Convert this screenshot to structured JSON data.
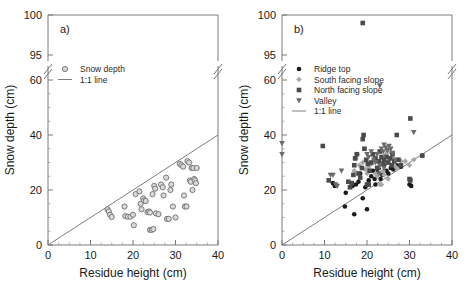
{
  "figure": {
    "panels": [
      {
        "letter": "a)",
        "xlabel": "Residue height (cm)",
        "ylabel": "Snow depth (cm)"
      },
      {
        "letter": "b)",
        "xlabel": "Residue height (cm)",
        "ylabel": "Snow depth (cm)"
      }
    ]
  },
  "axes": {
    "x_ticks": [
      "0",
      "10",
      "20",
      "30",
      "40"
    ],
    "y_ticks_lower": [
      "0",
      "20",
      "40",
      "60"
    ],
    "y_ticks_upper": [
      "95",
      "100"
    ]
  },
  "chart_data": [
    {
      "type": "scatter",
      "title": "a)",
      "xlabel": "Residue height (cm)",
      "ylabel": "Snow depth (cm)",
      "xlim": [
        0,
        40
      ],
      "ylim_lower": [
        0,
        60
      ],
      "ylim_upper": [
        95,
        100
      ],
      "axis_break": true,
      "grid": false,
      "legend_position": "upper-left",
      "legend": [
        {
          "label": "Snow depth",
          "marker": "open-circle",
          "color": "#6e6e6e"
        },
        {
          "label": "1:1 line",
          "marker": "line",
          "color": "#6e6e6e"
        }
      ],
      "reference_line": {
        "name": "1:1 line",
        "from": [
          0,
          0
        ],
        "to": [
          40,
          40
        ]
      },
      "series": [
        {
          "name": "Snow depth",
          "marker": "open-circle",
          "color": "#6e6e6e",
          "points": [
            [
              14.0,
              13.0
            ],
            [
              14.3,
              12.2
            ],
            [
              14.6,
              11.0
            ],
            [
              15.0,
              10.2
            ],
            [
              18.0,
              14.0
            ],
            [
              18.2,
              10.5
            ],
            [
              18.8,
              10.3
            ],
            [
              19.4,
              10.3
            ],
            [
              20.0,
              11.0
            ],
            [
              20.2,
              7.2
            ],
            [
              20.6,
              18.5
            ],
            [
              21.5,
              19.5
            ],
            [
              21.8,
              15.0
            ],
            [
              22.0,
              13.0
            ],
            [
              22.4,
              17.0
            ],
            [
              22.6,
              16.2
            ],
            [
              23.0,
              16.0
            ],
            [
              23.4,
              12.0
            ],
            [
              23.8,
              12.2
            ],
            [
              24.0,
              11.8
            ],
            [
              24.0,
              5.5
            ],
            [
              24.4,
              5.5
            ],
            [
              24.8,
              5.8
            ],
            [
              24.6,
              18.5
            ],
            [
              25.0,
              21.5
            ],
            [
              25.2,
              20.5
            ],
            [
              25.4,
              11.5
            ],
            [
              26.0,
              11.2
            ],
            [
              26.6,
              22.0
            ],
            [
              27.0,
              21.0
            ],
            [
              27.2,
              18.0
            ],
            [
              27.8,
              24.5
            ],
            [
              28.0,
              9.5
            ],
            [
              28.4,
              9.5
            ],
            [
              28.8,
              20.0
            ],
            [
              29.0,
              22.0
            ],
            [
              29.4,
              14.0
            ],
            [
              30.0,
              10.0
            ],
            [
              31.0,
              29.5
            ],
            [
              31.4,
              29.0
            ],
            [
              31.8,
              28.5
            ],
            [
              32.0,
              18.0
            ],
            [
              32.2,
              14.0
            ],
            [
              32.6,
              14.0
            ],
            [
              32.8,
              30.5
            ],
            [
              33.2,
              30.0
            ],
            [
              33.4,
              23.5
            ],
            [
              33.6,
              23.0
            ],
            [
              33.8,
              28.0
            ],
            [
              34.2,
              28.0
            ],
            [
              34.4,
              24.0
            ],
            [
              34.6,
              23.5
            ],
            [
              34.8,
              22.5
            ],
            [
              35.0,
              28.0
            ],
            [
              34.0,
              20.0
            ]
          ]
        }
      ]
    },
    {
      "type": "scatter",
      "title": "b)",
      "xlabel": "Residue height (cm)",
      "ylabel": "Snow depth (cm)",
      "xlim": [
        0,
        40
      ],
      "ylim_lower": [
        0,
        60
      ],
      "ylim_upper": [
        95,
        100
      ],
      "axis_break": true,
      "grid": false,
      "legend_position": "upper-left",
      "legend": [
        {
          "label": "Ridge top",
          "marker": "filled-circle",
          "color": "#1a1a1a"
        },
        {
          "label": "South facing slope",
          "marker": "filled-diamond",
          "color": "#a8a8a8"
        },
        {
          "label": "North facing slope",
          "marker": "filled-square",
          "color": "#4a4a4a"
        },
        {
          "label": "Valley",
          "marker": "filled-triangle-down",
          "color": "#6a6a6a"
        },
        {
          "label": "1:1 line",
          "marker": "line",
          "color": "#6e6e6e"
        }
      ],
      "reference_line": {
        "name": "1:1 line",
        "from": [
          0,
          0
        ],
        "to": [
          40,
          40
        ]
      },
      "series": [
        {
          "name": "Ridge top",
          "marker": "filled-circle",
          "color": "#1a1a1a",
          "points": [
            [
              12.0,
              22.5
            ],
            [
              12.4,
              21.5
            ],
            [
              14.8,
              14.0
            ],
            [
              15.0,
              19.0
            ],
            [
              16.6,
              21.5
            ],
            [
              17.0,
              11.2
            ],
            [
              17.4,
              22.0
            ],
            [
              18.0,
              23.0
            ],
            [
              18.4,
              26.0
            ],
            [
              19.0,
              17.0
            ],
            [
              19.6,
              21.0
            ],
            [
              20.0,
              13.0
            ],
            [
              20.4,
              23.5
            ],
            [
              21.0,
              25.0
            ],
            [
              21.4,
              27.0
            ],
            [
              21.8,
              24.0
            ],
            [
              22.0,
              22.0
            ],
            [
              22.4,
              26.5
            ],
            [
              22.8,
              28.0
            ],
            [
              23.2,
              24.0
            ],
            [
              23.6,
              25.5
            ],
            [
              24.0,
              29.0
            ],
            [
              24.6,
              27.0
            ],
            [
              25.0,
              26.0
            ],
            [
              25.6,
              28.0
            ],
            [
              26.2,
              27.5
            ],
            [
              27.0,
              29.0
            ],
            [
              28.0,
              28.5
            ],
            [
              30.0,
              22.0
            ],
            [
              30.4,
              21.5
            ]
          ]
        },
        {
          "name": "South facing slope",
          "marker": "filled-diamond",
          "color": "#a8a8a8",
          "points": [
            [
              17.0,
              27.0
            ],
            [
              17.4,
              31.5
            ],
            [
              17.8,
              33.0
            ],
            [
              18.2,
              29.0
            ],
            [
              19.0,
              30.0
            ],
            [
              19.6,
              27.5
            ],
            [
              20.0,
              26.0
            ],
            [
              20.4,
              28.5
            ],
            [
              21.0,
              29.5
            ],
            [
              21.6,
              31.0
            ],
            [
              22.0,
              26.0
            ],
            [
              22.4,
              25.0
            ],
            [
              22.8,
              28.5
            ],
            [
              23.0,
              22.0
            ],
            [
              23.4,
              22.0
            ],
            [
              23.8,
              27.0
            ],
            [
              24.0,
              30.0
            ],
            [
              24.4,
              33.0
            ],
            [
              24.8,
              34.0
            ],
            [
              25.2,
              35.0
            ],
            [
              25.6,
              33.5
            ],
            [
              26.0,
              31.5
            ],
            [
              26.4,
              29.0
            ],
            [
              27.0,
              28.0
            ],
            [
              28.0,
              30.5
            ],
            [
              29.0,
              30.5
            ],
            [
              30.0,
              29.0
            ],
            [
              31.0,
              31.0
            ],
            [
              33.0,
              32.5
            ],
            [
              24.0,
              25.5
            ],
            [
              25.0,
              24.0
            ]
          ]
        },
        {
          "name": "North facing slope",
          "marker": "filled-square",
          "color": "#4a4a4a",
          "points": [
            [
              19.0,
              99.0
            ],
            [
              9.6,
              36.0
            ],
            [
              11.0,
              23.5
            ],
            [
              15.6,
              23.0
            ],
            [
              16.0,
              21.0
            ],
            [
              16.4,
              22.5
            ],
            [
              16.8,
              25.5
            ],
            [
              17.0,
              29.0
            ],
            [
              17.2,
              31.5
            ],
            [
              17.6,
              33.0
            ],
            [
              18.0,
              26.0
            ],
            [
              18.4,
              24.5
            ],
            [
              18.8,
              28.0
            ],
            [
              19.0,
              38.5
            ],
            [
              19.2,
              40.0
            ],
            [
              19.4,
              35.0
            ],
            [
              19.8,
              31.0
            ],
            [
              20.2,
              29.5
            ],
            [
              20.6,
              27.0
            ],
            [
              21.0,
              30.0
            ],
            [
              21.4,
              33.0
            ],
            [
              22.0,
              31.5
            ],
            [
              22.4,
              28.0
            ],
            [
              22.8,
              30.5
            ],
            [
              23.0,
              34.0
            ],
            [
              23.4,
              32.0
            ],
            [
              23.8,
              29.5
            ],
            [
              24.0,
              31.0
            ],
            [
              24.6,
              32.0
            ],
            [
              25.0,
              30.0
            ],
            [
              25.4,
              31.5
            ],
            [
              25.8,
              29.0
            ],
            [
              26.0,
              33.0
            ],
            [
              26.4,
              30.5
            ],
            [
              27.0,
              40.0
            ],
            [
              27.4,
              31.0
            ],
            [
              28.0,
              29.0
            ],
            [
              30.2,
              46.0
            ],
            [
              30.0,
              24.0
            ],
            [
              30.2,
              23.5
            ],
            [
              33.0,
              32.5
            ],
            [
              20.0,
              22.0
            ],
            [
              20.4,
              22.0
            ]
          ]
        },
        {
          "name": "Valley",
          "marker": "filled-triangle-down",
          "color": "#6a6a6a",
          "points": [
            [
              0.0,
              37.0
            ],
            [
              0.0,
              33.0
            ],
            [
              11.4,
              25.5
            ],
            [
              12.0,
              25.5
            ],
            [
              12.6,
              22.0
            ],
            [
              13.0,
              21.5
            ],
            [
              14.0,
              27.0
            ],
            [
              19.0,
              66.0
            ],
            [
              20.0,
              33.0
            ],
            [
              20.4,
              32.0
            ],
            [
              21.0,
              34.0
            ],
            [
              21.6,
              31.0
            ],
            [
              22.0,
              30.0
            ],
            [
              22.4,
              33.0
            ],
            [
              23.0,
              58.0
            ],
            [
              23.4,
              35.0
            ],
            [
              23.8,
              34.0
            ],
            [
              24.0,
              36.5
            ],
            [
              24.4,
              35.5
            ],
            [
              24.8,
              34.5
            ],
            [
              25.2,
              36.0
            ],
            [
              25.6,
              35.0
            ],
            [
              26.0,
              33.5
            ],
            [
              26.6,
              31.0
            ],
            [
              31.0,
              41.0
            ],
            [
              23.0,
              29.0
            ],
            [
              24.0,
              28.0
            ],
            [
              22.8,
              26.0
            ]
          ]
        }
      ]
    }
  ]
}
